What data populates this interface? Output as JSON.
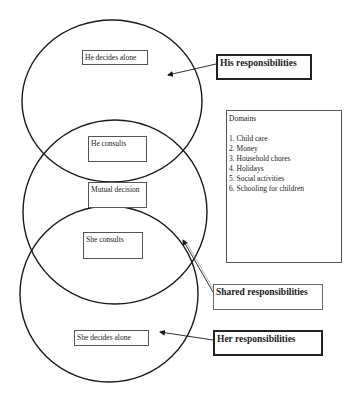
{
  "diagram": {
    "circles": [
      {
        "id": "his",
        "cx": 112,
        "cy": 101,
        "rx": 90,
        "ry": 81
      },
      {
        "id": "shared",
        "cx": 115,
        "cy": 212,
        "rx": 92,
        "ry": 92
      },
      {
        "id": "her",
        "cx": 109,
        "cy": 294,
        "rx": 89,
        "ry": 88
      }
    ],
    "nodes": {
      "he_decides_alone": "He decides alone",
      "he_consults": "He consults",
      "mutual_decision": "Mutual decision",
      "she_consults": "She consults",
      "she_decides_alone": "She decides alone"
    },
    "labels": {
      "his": "His responsibilities",
      "shared": "Shared responsibilities",
      "her": "Her responsibilities"
    },
    "domains": {
      "title": "Domains",
      "items": [
        "1. Child care",
        "2. Money",
        "3. Household chores",
        "4. Holidays",
        "5. Social activities",
        "6. Schooling for children"
      ]
    },
    "colors": {
      "stroke": "#1a1a1a",
      "background": "#ffffff"
    }
  }
}
